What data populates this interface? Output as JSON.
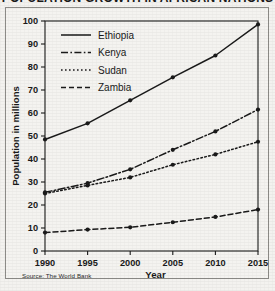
{
  "figure": {
    "title": "POPULATION GROWTH IN AFRICAN NATIONS",
    "source_note": "Source: The World Bank",
    "frame_color": "#8d8c88",
    "background_color": "#f3f2ef",
    "ink_color": "#1a1a1a"
  },
  "axes": {
    "x_label": "Year",
    "y_label": "Population in millions",
    "x_ticks": [
      "1990",
      "1995",
      "2000",
      "2005",
      "2010",
      "2015"
    ],
    "y_ticks": [
      "0",
      "10",
      "20",
      "30",
      "40",
      "50",
      "60",
      "70",
      "80",
      "90",
      "100"
    ]
  },
  "legend": {
    "entries": [
      {
        "label": "Ethiopia",
        "style": "solid"
      },
      {
        "label": "Kenya",
        "style": "dashdot"
      },
      {
        "label": "Sudan",
        "style": "dotted"
      },
      {
        "label": "Zambia",
        "style": "dashed"
      }
    ]
  },
  "chart_data": {
    "type": "line",
    "title": "POPULATION GROWTH IN AFRICAN NATIONS",
    "xlabel": "Year",
    "ylabel": "Population in millions",
    "x": [
      1990,
      1995,
      2000,
      2005,
      2010,
      2015
    ],
    "xlim": [
      1990,
      2015
    ],
    "ylim": [
      0,
      100
    ],
    "ytick_step": 10,
    "grid": false,
    "legend_position": "upper-left-inside",
    "markers": "filled-circle",
    "series": [
      {
        "name": "Ethiopia",
        "style": "solid",
        "values": [
          48.5,
          55.5,
          65.5,
          75.5,
          85.0,
          98.5
        ]
      },
      {
        "name": "Kenya",
        "style": "dashdot",
        "values": [
          25.5,
          29.5,
          35.5,
          44.0,
          52.0,
          61.5
        ]
      },
      {
        "name": "Sudan",
        "style": "dotted",
        "values": [
          25.0,
          28.5,
          32.0,
          37.5,
          42.0,
          47.5
        ]
      },
      {
        "name": "Zambia",
        "style": "dashed",
        "values": [
          8.0,
          9.3,
          10.3,
          12.5,
          14.8,
          18.0
        ]
      }
    ]
  }
}
